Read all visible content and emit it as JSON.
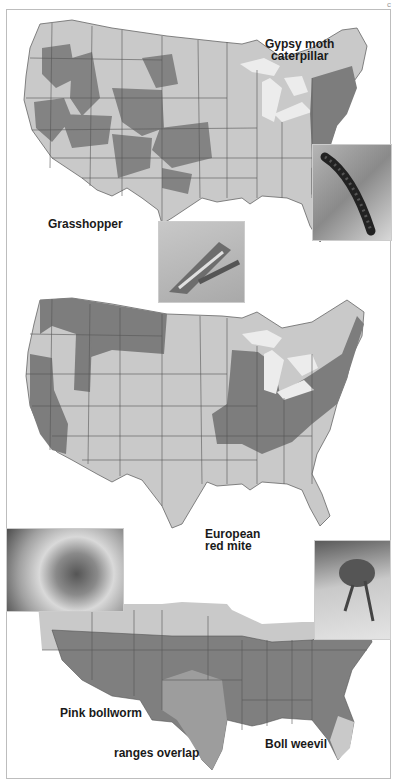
{
  "page_marker": "c",
  "figure": {
    "maps": [
      {
        "id": "map-1",
        "labels": [
          {
            "text": "Gypsy moth\ncaterpillar",
            "line1": "Gypsy moth",
            "line2": "caterpillar"
          },
          {
            "text": "Grasshopper"
          }
        ],
        "photos": [
          "caterpillar-photo",
          "grasshopper-photo"
        ]
      },
      {
        "id": "map-2",
        "labels": [
          {
            "text": "European red mite",
            "line1": "European",
            "line2": "red mite"
          }
        ],
        "photos": []
      },
      {
        "id": "map-3",
        "labels": [
          {
            "text": "Pink bollworm"
          },
          {
            "text": "ranges overlap"
          },
          {
            "text": "Boll weevil"
          }
        ],
        "photos": [
          "pink-bollworm-photo",
          "boll-weevil-photo"
        ]
      }
    ],
    "colors": {
      "land_light": "#c9c9c9",
      "range_dark": "#7d7d7d",
      "range_medium": "#9a9a9a",
      "lake": "#e8e8e8",
      "border": "#555555",
      "frame": "#bdbdbd"
    }
  }
}
